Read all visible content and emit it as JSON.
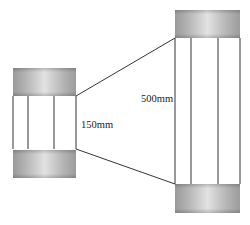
{
  "diagram": {
    "small_pipe": {
      "diameter_label": "150mm"
    },
    "large_pipe": {
      "diameter_label": "500mm"
    },
    "colors": {
      "line": "#333333",
      "cap_dark": "#9a9a9a",
      "cap_light": "#e6e6e6",
      "background": "#ffffff"
    }
  }
}
